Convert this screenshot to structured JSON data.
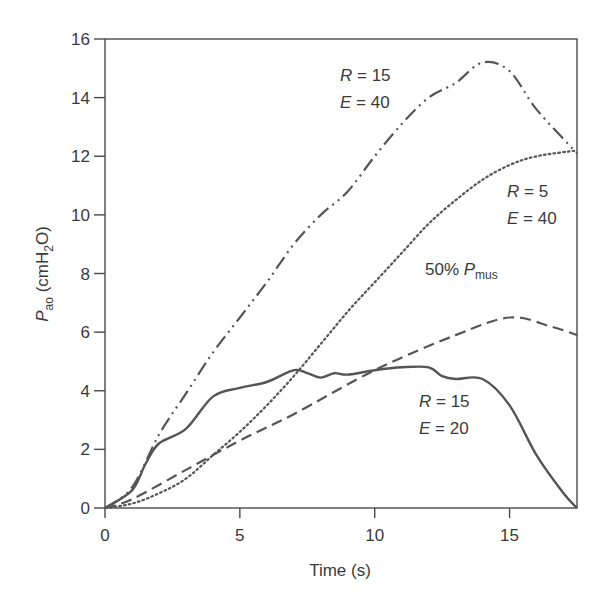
{
  "chart_data": {
    "type": "line",
    "title": "",
    "xlabel": "Time (s)",
    "ylabel": "P_ao (cmH2O)",
    "ylabel_parts": {
      "main": "P",
      "sub": "ao",
      "unit_pre": " (cmH",
      "unit_sub": "2",
      "unit_post": "O)"
    },
    "xlim": [
      0,
      17.5
    ],
    "ylim": [
      0,
      16
    ],
    "xticks": [
      0,
      5,
      10,
      15
    ],
    "yticks": [
      0,
      2,
      4,
      6,
      8,
      10,
      12,
      14,
      16
    ],
    "grid": false,
    "legend": "inline annotations",
    "series": [
      {
        "name": "R = 15, E = 40",
        "style": "dash-dot",
        "x": [
          0,
          1,
          2,
          3,
          4,
          5,
          6,
          7,
          8,
          9,
          10,
          11,
          12,
          13,
          14,
          15,
          16,
          17.5
        ],
        "values": [
          0,
          0.7,
          2.5,
          3.9,
          5.3,
          6.5,
          7.7,
          9.0,
          10.0,
          10.8,
          12.0,
          13.1,
          14.0,
          14.5,
          15.2,
          14.9,
          13.6,
          12.1
        ]
      },
      {
        "name": "R = 5, E = 40",
        "style": "dotted",
        "x": [
          0,
          1,
          2,
          3,
          4,
          5,
          6,
          7,
          8,
          9,
          10,
          11,
          12,
          13,
          14,
          15,
          16,
          17.5
        ],
        "values": [
          0,
          0.15,
          0.5,
          1.0,
          1.8,
          2.6,
          3.5,
          4.5,
          5.6,
          6.7,
          7.7,
          8.7,
          9.7,
          10.5,
          11.2,
          11.7,
          12.0,
          12.2
        ]
      },
      {
        "name": "50% Pmus",
        "style": "dashed",
        "x": [
          0,
          1,
          3,
          5,
          7,
          10,
          13,
          15,
          16.5,
          17.5
        ],
        "values": [
          0,
          0.3,
          1.3,
          2.3,
          3.2,
          4.7,
          5.9,
          6.5,
          6.2,
          5.9
        ]
      },
      {
        "name": "R = 15, E = 20",
        "style": "solid",
        "x": [
          0,
          1,
          1.5,
          2,
          3,
          4,
          5,
          6,
          7,
          7.5,
          8,
          8.5,
          9,
          10,
          11,
          12,
          12.5,
          13,
          14,
          15,
          16,
          17,
          17.5
        ],
        "values": [
          0,
          0.6,
          1.5,
          2.2,
          2.7,
          3.8,
          4.1,
          4.3,
          4.7,
          4.6,
          4.45,
          4.6,
          4.55,
          4.7,
          4.8,
          4.8,
          4.5,
          4.4,
          4.4,
          3.5,
          1.8,
          0.5,
          0
        ]
      }
    ],
    "annotations": [
      {
        "text_var": "R",
        "text_val": " = 15",
        "text_var2": "E",
        "text_val2": " = 40",
        "target": "R = 15, E = 40"
      },
      {
        "text_var": "R",
        "text_val": " = 5",
        "text_var2": "E",
        "text_val2": " = 40",
        "target": "R = 5, E = 40"
      },
      {
        "text_pre": "50% ",
        "text_var": "P",
        "text_sub": "mus",
        "target": "50% Pmus"
      },
      {
        "text_var": "R",
        "text_val": " = 15",
        "text_var2": "E",
        "text_val2": " = 20",
        "target": "R = 15, E = 20"
      }
    ]
  },
  "colors": {
    "line": "#555555",
    "axis": "#4a4a4a",
    "text": "#3a3a3a",
    "background": "#ffffff"
  }
}
